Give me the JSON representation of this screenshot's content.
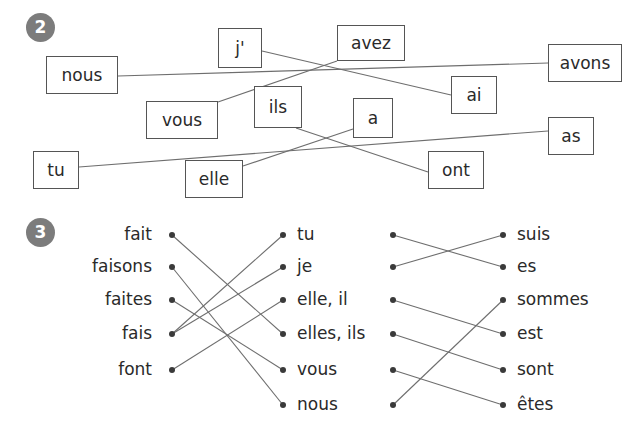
{
  "page": {
    "width": 639,
    "height": 434,
    "background": "#ffffff",
    "ink_color": "#2a2a2a",
    "line_color": "#6e6e6e",
    "badge_color": "#7c7c7c",
    "box_border_color": "#555555"
  },
  "exercise2": {
    "badge": "2",
    "boxes": [
      {
        "id": "nous",
        "label": "nous",
        "x": 46,
        "y": 56,
        "w": 72,
        "h": 38
      },
      {
        "id": "j",
        "label": "j'",
        "x": 218,
        "y": 28,
        "w": 44,
        "h": 40
      },
      {
        "id": "avez",
        "label": "avez",
        "x": 337,
        "y": 25,
        "w": 68,
        "h": 36
      },
      {
        "id": "avons",
        "label": "avons",
        "x": 548,
        "y": 44,
        "w": 74,
        "h": 38
      },
      {
        "id": "ai",
        "label": "ai",
        "x": 451,
        "y": 76,
        "w": 46,
        "h": 38
      },
      {
        "id": "vous",
        "label": "vous",
        "x": 146,
        "y": 101,
        "w": 72,
        "h": 38
      },
      {
        "id": "ils",
        "label": "ils",
        "x": 254,
        "y": 86,
        "w": 48,
        "h": 42
      },
      {
        "id": "a",
        "label": "a",
        "x": 353,
        "y": 98,
        "w": 40,
        "h": 40
      },
      {
        "id": "as",
        "label": "as",
        "x": 548,
        "y": 117,
        "w": 46,
        "h": 38
      },
      {
        "id": "tu",
        "label": "tu",
        "x": 33,
        "y": 151,
        "w": 46,
        "h": 38
      },
      {
        "id": "elle",
        "label": "elle",
        "x": 185,
        "y": 160,
        "w": 58,
        "h": 38
      },
      {
        "id": "ont",
        "label": "ont",
        "x": 428,
        "y": 151,
        "w": 56,
        "h": 38
      }
    ],
    "connections": [
      {
        "from": "nous",
        "to": "avons",
        "x1": 118,
        "y1": 76,
        "x2": 548,
        "y2": 63
      },
      {
        "from": "j",
        "to": "ai",
        "x1": 262,
        "y1": 51,
        "x2": 451,
        "y2": 95
      },
      {
        "from": "vous",
        "to": "avez",
        "x1": 218,
        "y1": 102,
        "x2": 337,
        "y2": 61
      },
      {
        "from": "tu",
        "to": "as",
        "x1": 79,
        "y1": 167,
        "x2": 548,
        "y2": 131
      },
      {
        "from": "ils",
        "to": "ont",
        "x1": 296,
        "y1": 128,
        "x2": 428,
        "y2": 172
      },
      {
        "from": "elle",
        "to": "a",
        "x1": 243,
        "y1": 166,
        "x2": 353,
        "y2": 129
      }
    ]
  },
  "exercise3": {
    "badge": "3",
    "faire": {
      "left_labels": [
        "fait",
        "faisons",
        "faites",
        "fais",
        "font"
      ],
      "right_labels": [
        "tu",
        "je",
        "elle, il",
        "elles, ils",
        "vous",
        "nous"
      ],
      "left_dot_x": 172,
      "right_dot_x": 283,
      "left_dot_y": [
        235,
        267,
        300,
        334,
        370
      ],
      "right_dot_y": [
        235,
        267,
        300,
        334,
        370,
        405
      ],
      "left_label_right_edge": 152,
      "right_label_left_edge": 297,
      "connections": [
        {
          "from": "fait",
          "to": "elles, ils",
          "x1": 172,
          "y1": 235,
          "x2": 283,
          "y2": 334
        },
        {
          "from": "faisons",
          "to": "nous",
          "x1": 172,
          "y1": 267,
          "x2": 283,
          "y2": 405
        },
        {
          "from": "faites",
          "to": "vous",
          "x1": 172,
          "y1": 300,
          "x2": 283,
          "y2": 370
        },
        {
          "from": "fais",
          "to": "tu",
          "x1": 172,
          "y1": 334,
          "x2": 283,
          "y2": 235
        },
        {
          "from": "fais",
          "to": "je",
          "x1": 172,
          "y1": 334,
          "x2": 283,
          "y2": 267
        },
        {
          "from": "font",
          "to": "elle, il",
          "x1": 172,
          "y1": 370,
          "x2": 283,
          "y2": 300
        }
      ]
    },
    "etre": {
      "left_labels": [
        "tu",
        "je",
        "elle, il",
        "elles, ils",
        "vous",
        "nous"
      ],
      "right_labels": [
        "suis",
        "es",
        "sommes",
        "est",
        "sont",
        "êtes"
      ],
      "left_dot_x": 393,
      "right_dot_x": 503,
      "left_dot_y": [
        235,
        267,
        300,
        334,
        370,
        405
      ],
      "right_dot_y": [
        235,
        267,
        300,
        334,
        370,
        405
      ],
      "right_label_left_edge": 517,
      "connections": [
        {
          "from": "tu",
          "to": "es",
          "x1": 393,
          "y1": 235,
          "x2": 503,
          "y2": 267
        },
        {
          "from": "je",
          "to": "suis",
          "x1": 393,
          "y1": 267,
          "x2": 503,
          "y2": 235
        },
        {
          "from": "elle, il",
          "to": "est",
          "x1": 393,
          "y1": 300,
          "x2": 503,
          "y2": 334
        },
        {
          "from": "elles, ils",
          "to": "sont",
          "x1": 393,
          "y1": 334,
          "x2": 503,
          "y2": 370
        },
        {
          "from": "vous",
          "to": "êtes",
          "x1": 393,
          "y1": 370,
          "x2": 503,
          "y2": 405
        },
        {
          "from": "nous",
          "to": "sommes",
          "x1": 393,
          "y1": 405,
          "x2": 503,
          "y2": 300
        }
      ]
    }
  }
}
